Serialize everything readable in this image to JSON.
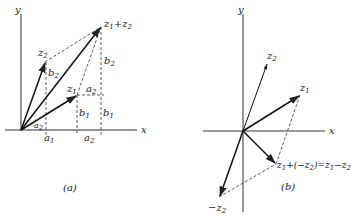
{
  "panel_a": {
    "caption": "(a)",
    "axis_x": "x",
    "axis_y": "y",
    "labels": {
      "z2": {
        "base": "z",
        "sub": "2"
      },
      "z1": {
        "base": "z",
        "sub": "1"
      },
      "sum": {
        "base1": "z",
        "sub1": "1",
        "plus": "+",
        "base2": "z",
        "sub2": "2"
      },
      "b2_left": {
        "base": "b",
        "sub": "2"
      },
      "b2_right": {
        "base": "b",
        "sub": "2"
      },
      "a2_top": {
        "base": "a",
        "sub": "2"
      },
      "a2_small": {
        "base": "a",
        "sub": "2"
      },
      "b1_mid": {
        "base": "b",
        "sub": "1"
      },
      "b1_right": {
        "base": "b",
        "sub": "1"
      },
      "a1_axis": {
        "base": "a",
        "sub": "1"
      },
      "a2_axis": {
        "base": "a",
        "sub": "2"
      }
    }
  },
  "panel_b": {
    "caption": "(b)",
    "axis_x": "x",
    "axis_y": "y",
    "labels": {
      "z2": {
        "base": "z",
        "sub": "2"
      },
      "z1": {
        "base": "z",
        "sub": "1"
      },
      "neg_z2": {
        "base": "−z",
        "sub": "2"
      },
      "diff": {
        "p1": "z",
        "s1": "1",
        "p2": "+(−z",
        "s2": "2",
        "p3": ")=z",
        "s3": "1",
        "p4": "−z",
        "s4": "2"
      }
    }
  },
  "colors": {
    "ink": "#222222",
    "background": "#ffffff"
  }
}
